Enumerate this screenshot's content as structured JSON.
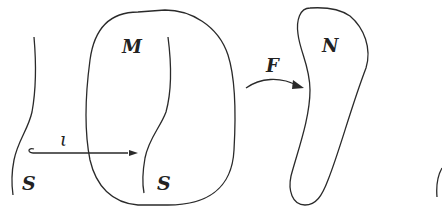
{
  "diagram": {
    "type": "manifold-embedding-illustration",
    "labels": {
      "source_submanifold": "S",
      "inclusion_map": "ι",
      "manifold": "M",
      "embedded_submanifold": "S",
      "map": "F",
      "target_manifold": "N"
    },
    "arrows": [
      {
        "from": "S",
        "to": "S in M",
        "label": "ι",
        "style": "hooked"
      },
      {
        "from": "M",
        "to": "N",
        "label": "F",
        "style": "curved"
      }
    ],
    "colors": {
      "stroke": "#2a2a2a",
      "background": "#ffffff",
      "text": "#222222"
    }
  }
}
